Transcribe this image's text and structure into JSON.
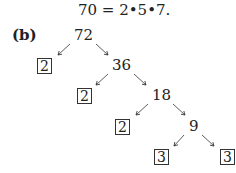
{
  "equation": "70 = 2•5•7.",
  "part_label": "(b)",
  "tree": {
    "nodes": [
      {
        "value": "72",
        "boxed": false
      },
      {
        "value": "2",
        "boxed": true
      },
      {
        "value": "36",
        "boxed": false
      },
      {
        "value": "2",
        "boxed": true
      },
      {
        "value": "18",
        "boxed": false
      },
      {
        "value": "2",
        "boxed": true
      },
      {
        "value": "9",
        "boxed": false
      },
      {
        "value": "3",
        "boxed": true
      },
      {
        "value": "3",
        "boxed": true
      }
    ]
  }
}
